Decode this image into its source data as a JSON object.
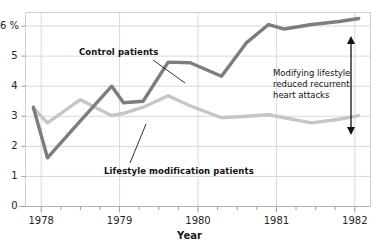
{
  "chart_data": {
    "type": "line",
    "title": "",
    "xlabel": "Year",
    "ylabel": "",
    "ylim": [
      0,
      6.45
    ],
    "xlim": [
      1977.8,
      1982.2
    ],
    "grid": true,
    "legend_position": "inline-callouts",
    "y_ticks": [
      {
        "value": 0,
        "label": "0"
      },
      {
        "value": 1,
        "label": "1"
      },
      {
        "value": 2,
        "label": "2"
      },
      {
        "value": 3,
        "label": "3"
      },
      {
        "value": 4,
        "label": "4"
      },
      {
        "value": 5,
        "label": "5"
      },
      {
        "value": 6,
        "label": "6 %"
      }
    ],
    "x_ticks": [
      {
        "value": 1978,
        "label": "1978"
      },
      {
        "value": 1979,
        "label": "1979"
      },
      {
        "value": 1980,
        "label": "1980"
      },
      {
        "value": 1981,
        "label": "1981"
      },
      {
        "value": 1982,
        "label": "1982"
      }
    ],
    "x_minor_step": 0.25,
    "series": [
      {
        "name": "Control patients",
        "color": "#7d7d7d",
        "x": [
          1977.9,
          1978.08,
          1978.5,
          1978.9,
          1979.05,
          1979.3,
          1979.62,
          1979.9,
          1980.3,
          1980.62,
          1980.9,
          1981.1,
          1981.45,
          1981.8,
          1982.05
        ],
        "values": [
          3.3,
          1.62,
          2.85,
          4.0,
          3.45,
          3.5,
          4.8,
          4.78,
          4.33,
          5.45,
          6.05,
          5.9,
          6.05,
          6.15,
          6.25
        ]
      },
      {
        "name": "Lifestyle modification patients",
        "color": "#c6c6c6",
        "x": [
          1977.9,
          1978.08,
          1978.5,
          1978.9,
          1979.05,
          1979.3,
          1979.62,
          1979.9,
          1980.3,
          1980.62,
          1980.9,
          1981.1,
          1981.45,
          1981.8,
          1982.05
        ],
        "values": [
          3.28,
          2.78,
          3.55,
          3.02,
          3.1,
          3.3,
          3.68,
          3.35,
          2.95,
          3.0,
          3.05,
          2.95,
          2.78,
          2.9,
          3.02
        ]
      }
    ],
    "annotations": [
      {
        "name": "control-patients-callout",
        "text": "Control patients",
        "label_x": 79,
        "label_y": 47,
        "leader": {
          "x1": 153,
          "y1": 60,
          "x2": 185,
          "y2": 83
        }
      },
      {
        "name": "lifestyle-patients-callout",
        "text": "Lifestyle modification patients",
        "label_x": 104,
        "label_y": 166,
        "leader": {
          "x1": 130,
          "y1": 163,
          "x2": 146,
          "y2": 124
        }
      }
    ],
    "gap_annotation": {
      "name": "gap-annotation",
      "lines": [
        "Modifying lifestyle",
        "reduced recurrent",
        "heart attacks"
      ],
      "x": 273,
      "y": 68,
      "arrow": {
        "x": 351,
        "y_top": 36,
        "y_bottom": 135
      }
    }
  },
  "style": {
    "background": "#ffffff",
    "grid_color": "#d9d9d9",
    "frame_color": "#cfcfcf",
    "text_color": "#262626",
    "control_color": "#7d7d7d",
    "lifestyle_color": "#c6c6c6"
  }
}
